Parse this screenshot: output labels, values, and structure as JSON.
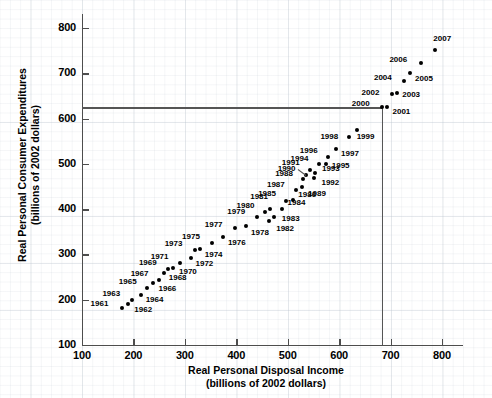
{
  "chart_data": {
    "type": "scatter",
    "title": "",
    "xlabel": "Real Personal Disposal Income",
    "xlabel_sub": "(billions of 2002 dollars)",
    "ylabel": "Real Personal Consumer Expenditures",
    "ylabel_sub": "(billions of 2002 dollars)",
    "xlim": [
      100,
      840
    ],
    "ylim": [
      100,
      830
    ],
    "xticks": [
      100,
      200,
      300,
      400,
      500,
      600,
      700,
      800
    ],
    "yticks": [
      100,
      200,
      300,
      400,
      500,
      600,
      700,
      800
    ],
    "grid": true,
    "legend": "none",
    "point_label_field": "year",
    "reference_lines": {
      "horizontal_y": 625,
      "vertical_x": 683,
      "note": "lines cross at the year 2000 point"
    },
    "points": [
      {
        "year": "1961",
        "x": 177,
        "y": 182,
        "lx": -31,
        "ly": -4
      },
      {
        "year": "1962",
        "x": 190,
        "y": 190,
        "lx": 6,
        "ly": 6
      },
      {
        "year": "1963",
        "x": 198,
        "y": 200,
        "lx": -30,
        "ly": -6
      },
      {
        "year": "1964",
        "x": 214,
        "y": 211,
        "lx": 5,
        "ly": 5
      },
      {
        "year": "1965",
        "x": 226,
        "y": 226,
        "lx": -28,
        "ly": -6
      },
      {
        "year": "1966",
        "x": 239,
        "y": 237,
        "lx": 5,
        "ly": 6
      },
      {
        "year": "1967",
        "x": 249,
        "y": 244,
        "lx": -28,
        "ly": -6
      },
      {
        "year": "1968",
        "x": 259,
        "y": 258,
        "lx": 5,
        "ly": 5
      },
      {
        "year": "1969",
        "x": 267,
        "y": 267,
        "lx": -29,
        "ly": -6
      },
      {
        "year": "1970",
        "x": 277,
        "y": 271,
        "lx": 6,
        "ly": 4
      },
      {
        "year": "1971",
        "x": 290,
        "y": 281,
        "lx": -29,
        "ly": -6
      },
      {
        "year": "1972",
        "x": 311,
        "y": 293,
        "lx": 5,
        "ly": 6
      },
      {
        "year": "1973",
        "x": 319,
        "y": 310,
        "lx": -30,
        "ly": -6
      },
      {
        "year": "1974",
        "x": 329,
        "y": 311,
        "lx": 5,
        "ly": 6
      },
      {
        "year": "1975",
        "x": 353,
        "y": 326,
        "lx": -30,
        "ly": -6
      },
      {
        "year": "1976",
        "x": 374,
        "y": 339,
        "lx": 5,
        "ly": 6
      },
      {
        "year": "1977",
        "x": 397,
        "y": 359,
        "lx": -30,
        "ly": -3
      },
      {
        "year": "1978",
        "x": 419,
        "y": 362,
        "lx": 5,
        "ly": 7
      },
      {
        "year": "1979",
        "x": 441,
        "y": 382,
        "lx": -30,
        "ly": -5
      },
      {
        "year": "1980",
        "x": 455,
        "y": 393,
        "lx": -28,
        "ly": -6
      },
      {
        "year": "1981",
        "x": 466,
        "y": 400,
        "lx": -20,
        "ly": -12
      },
      {
        "year": "1982",
        "x": 464,
        "y": 374,
        "lx": 7,
        "ly": 8
      },
      {
        "year": "1983",
        "x": 473,
        "y": 383,
        "lx": 8,
        "ly": 2
      },
      {
        "year": "1984",
        "x": 488,
        "y": 400,
        "lx": 6,
        "ly": -6
      },
      {
        "year": "1985",
        "x": 497,
        "y": 419,
        "lx": -28,
        "ly": -7
      },
      {
        "year": "1986",
        "x": 511,
        "y": 420,
        "lx": 5,
        "ly": -5
      },
      {
        "year": "1987",
        "x": 516,
        "y": 442,
        "lx": -29,
        "ly": -5
      },
      {
        "year": "1988",
        "x": 530,
        "y": 466,
        "lx": -28,
        "ly": -5
      },
      {
        "year": "1989",
        "x": 528,
        "y": 448,
        "lx": 6,
        "ly": 7
      },
      {
        "year": "1990",
        "x": 535,
        "y": 475,
        "lx": -28,
        "ly": -6
      },
      {
        "year": "1991",
        "x": 543,
        "y": 486,
        "lx": -28,
        "ly": -7
      },
      {
        "year": "1992",
        "x": 552,
        "y": 468,
        "lx": 7,
        "ly": 5
      },
      {
        "year": "1993",
        "x": 553,
        "y": 480,
        "lx": 7,
        "ly": -4
      },
      {
        "year": "1994",
        "x": 560,
        "y": 500,
        "lx": -28,
        "ly": -5
      },
      {
        "year": "1995",
        "x": 574,
        "y": 500,
        "lx": 6,
        "ly": 2
      },
      {
        "year": "1996",
        "x": 578,
        "y": 516,
        "lx": -28,
        "ly": -6
      },
      {
        "year": "1997",
        "x": 594,
        "y": 533,
        "lx": 5,
        "ly": 5
      },
      {
        "year": "1998",
        "x": 620,
        "y": 559,
        "lx": -29,
        "ly": 0
      },
      {
        "year": "1999",
        "x": 634,
        "y": 575,
        "lx": 0,
        "ly": 7
      },
      {
        "year": "2000",
        "x": 683,
        "y": 625,
        "lx": -30,
        "ly": -3
      },
      {
        "year": "2001",
        "x": 694,
        "y": 626,
        "lx": 5,
        "ly": 5
      },
      {
        "year": "2002",
        "x": 702,
        "y": 654,
        "lx": -30,
        "ly": -1
      },
      {
        "year": "2003",
        "x": 713,
        "y": 657,
        "lx": 5,
        "ly": 2
      },
      {
        "year": "2004",
        "x": 726,
        "y": 684,
        "lx": -30,
        "ly": -3
      },
      {
        "year": "2005",
        "x": 738,
        "y": 700,
        "lx": 5,
        "ly": 6
      },
      {
        "year": "2006",
        "x": 760,
        "y": 722,
        "lx": -32,
        "ly": -3
      },
      {
        "year": "2007",
        "x": 787,
        "y": 752,
        "lx": -2,
        "ly": -11
      }
    ]
  }
}
